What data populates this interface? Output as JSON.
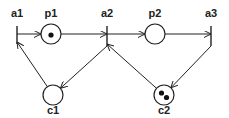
{
  "diagram": {
    "type": "petri-net",
    "places": [
      {
        "id": "p1",
        "label": "p1",
        "tokens": 1
      },
      {
        "id": "p2",
        "label": "p2",
        "tokens": 0
      },
      {
        "id": "c1",
        "label": "c1",
        "tokens": 0
      },
      {
        "id": "c2",
        "label": "c2",
        "tokens": 2
      }
    ],
    "transitions": [
      {
        "id": "a1",
        "label": "a1"
      },
      {
        "id": "a2",
        "label": "a2"
      },
      {
        "id": "a3",
        "label": "a3"
      }
    ],
    "arcs": [
      {
        "from": "a1",
        "to": "p1"
      },
      {
        "from": "p1",
        "to": "a2"
      },
      {
        "from": "a2",
        "to": "p2"
      },
      {
        "from": "p2",
        "to": "a3"
      },
      {
        "from": "a3",
        "to": "c2"
      },
      {
        "from": "c2",
        "to": "a2"
      },
      {
        "from": "a2",
        "to": "c1"
      },
      {
        "from": "c1",
        "to": "a1"
      }
    ]
  }
}
